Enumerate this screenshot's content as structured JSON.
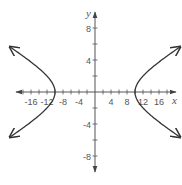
{
  "chart_data": {
    "type": "line",
    "title": "",
    "xlabel": "x",
    "ylabel": "y",
    "xlim": [
      -20,
      20
    ],
    "ylim": [
      -10,
      10
    ],
    "grid": false,
    "legend": null,
    "equation": "x^2/100 - y^2/9 = 1",
    "x_tick_labels": [
      "-16",
      "-12",
      "-8",
      "-4",
      "4",
      "8",
      "12",
      "16"
    ],
    "x_tick_values": [
      -16,
      -12,
      -8,
      -4,
      4,
      8,
      12,
      16
    ],
    "x_minor_tick_step": 2,
    "y_tick_labels": [
      "8",
      "4",
      "-4",
      "-8"
    ],
    "y_tick_values": [
      8,
      4,
      -4,
      -8
    ],
    "y_minor_tick_step": 2,
    "vertices": [
      [
        -10,
        0
      ],
      [
        10,
        0
      ]
    ],
    "series": [
      {
        "name": "right branch",
        "x": [
          20,
          16,
          13,
          11,
          10,
          11,
          13,
          16,
          20
        ],
        "y": [
          5.2,
          3.75,
          2.49,
          1.38,
          0,
          -1.38,
          -2.49,
          -3.75,
          -5.2
        ],
        "arrows": "both-ends"
      },
      {
        "name": "left branch",
        "x": [
          -20,
          -16,
          -13,
          -11,
          -10,
          -11,
          -13,
          -16,
          -20
        ],
        "y": [
          5.2,
          3.75,
          2.49,
          1.38,
          0,
          -1.38,
          -2.49,
          -3.75,
          -5.2
        ],
        "arrows": "both-ends"
      }
    ],
    "colors": {
      "axis": "#555555",
      "curve": "#333333",
      "text": "#555555"
    }
  }
}
